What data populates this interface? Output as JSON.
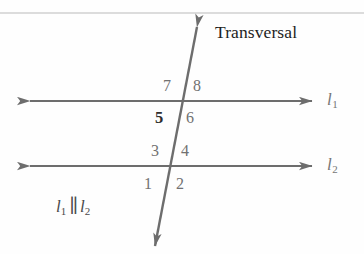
{
  "figure": {
    "name": "parallel-lines-transversal-diagram",
    "background_color": "#fefefe",
    "top_rule_color": "#b9b9b9",
    "stroke_color": "#6d6d6d",
    "label_color": "#767676",
    "dark_text_color": "#1d1d1d"
  },
  "labels": {
    "transversal": "Transversal",
    "line1": "l",
    "line1_sub": "1",
    "line2": "l",
    "line2_sub": "2",
    "parallel_symbol": "∥"
  },
  "angles": [
    {
      "id": "angle-7",
      "text": "7",
      "x": 163,
      "y": 78,
      "emphasis": "normal"
    },
    {
      "id": "angle-8",
      "text": "8",
      "x": 193,
      "y": 78,
      "emphasis": "normal"
    },
    {
      "id": "angle-5",
      "text": "5",
      "x": 155,
      "y": 110,
      "emphasis": "dark"
    },
    {
      "id": "angle-6",
      "text": "6",
      "x": 186,
      "y": 110,
      "emphasis": "normal"
    },
    {
      "id": "angle-3",
      "text": "3",
      "x": 151,
      "y": 143,
      "emphasis": "normal"
    },
    {
      "id": "angle-4",
      "text": "4",
      "x": 181,
      "y": 143,
      "emphasis": "normal"
    },
    {
      "id": "angle-1",
      "text": "1",
      "x": 144,
      "y": 176,
      "emphasis": "normal"
    },
    {
      "id": "angle-2",
      "text": "2",
      "x": 176,
      "y": 176,
      "emphasis": "normal"
    }
  ],
  "geometry": {
    "line1_y": 101,
    "line2_y": 166,
    "line_left_x": 30,
    "line_right_x": 312,
    "transversal_top": {
      "x": 197,
      "y": 27
    },
    "transversal_bottom": {
      "x": 155,
      "y": 246
    },
    "top_rule_y": 13
  }
}
